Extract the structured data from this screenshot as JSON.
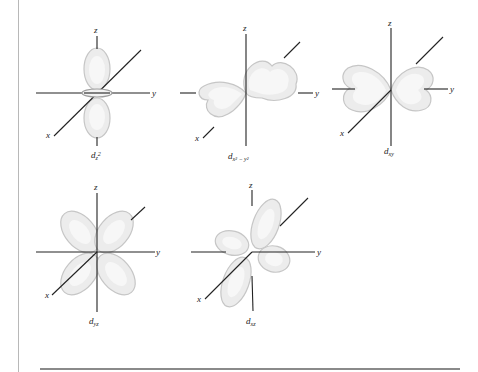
{
  "figure": {
    "orbitals": [
      {
        "id": "dz2",
        "name": "d",
        "subscript": "z",
        "superscript": "2",
        "label": "d_{z^2}",
        "axes": {
          "x": "x",
          "y": "y",
          "z": "z"
        }
      },
      {
        "id": "dx2y2",
        "name": "d",
        "subscript": "x² − y²",
        "label": "d_{x^2-y^2}",
        "axes": {
          "x": "x",
          "y": "y",
          "z": "z"
        }
      },
      {
        "id": "dxy",
        "name": "d",
        "subscript": "xy",
        "label": "d_{xy}",
        "axes": {
          "x": "x",
          "y": "y",
          "z": "z"
        }
      },
      {
        "id": "dyz",
        "name": "d",
        "subscript": "yz",
        "label": "d_{yz}",
        "axes": {
          "x": "x",
          "y": "y",
          "z": "z"
        }
      },
      {
        "id": "dxz",
        "name": "d",
        "subscript": "xz",
        "label": "d_{xz}",
        "axes": {
          "x": "x",
          "y": "y",
          "z": "z"
        }
      }
    ]
  },
  "colors": {
    "axis": "#222222",
    "lobe_fill": "#ececec",
    "lobe_edge": "#c6c6c6",
    "page_rule": "#8a8a8a"
  }
}
